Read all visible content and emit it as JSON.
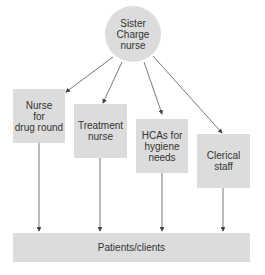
{
  "diagram": {
    "root": {
      "label": "Sister\nCharge\nnurse"
    },
    "roles": [
      {
        "label": "Nurse\nfor\ndrug round"
      },
      {
        "label": "Treatment\nnurse"
      },
      {
        "label": "HCAs for\nhygiene\nneeds"
      },
      {
        "label": "Clerical\nstaff"
      }
    ],
    "target": {
      "label": "Patients/clients"
    },
    "colors": {
      "node_fill": "#dcdcdc",
      "edge": "#555555",
      "text": "#333333"
    }
  }
}
